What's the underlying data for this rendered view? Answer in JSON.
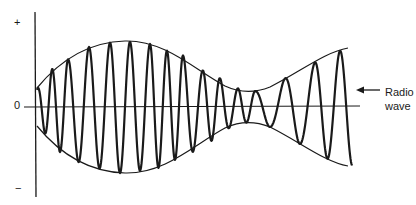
{
  "diagram": {
    "title": "",
    "axis_labels": {
      "positive": "+",
      "zero": "0",
      "negative": "−"
    },
    "annotation": {
      "line1": "Radio",
      "line2": "wave",
      "arrow": "left-arrow"
    },
    "envelope_points": [
      [
        37,
        88
      ],
      [
        60,
        62
      ],
      [
        90,
        47
      ],
      [
        120,
        41
      ],
      [
        150,
        44
      ],
      [
        180,
        55
      ],
      [
        210,
        73
      ],
      [
        235,
        88
      ],
      [
        250,
        92
      ],
      [
        270,
        87
      ],
      [
        300,
        70
      ],
      [
        330,
        55
      ],
      [
        348,
        48
      ]
    ],
    "carrier_cycles": 15,
    "colors": {
      "ink": "#1a1a1a",
      "background": "#ffffff"
    }
  }
}
